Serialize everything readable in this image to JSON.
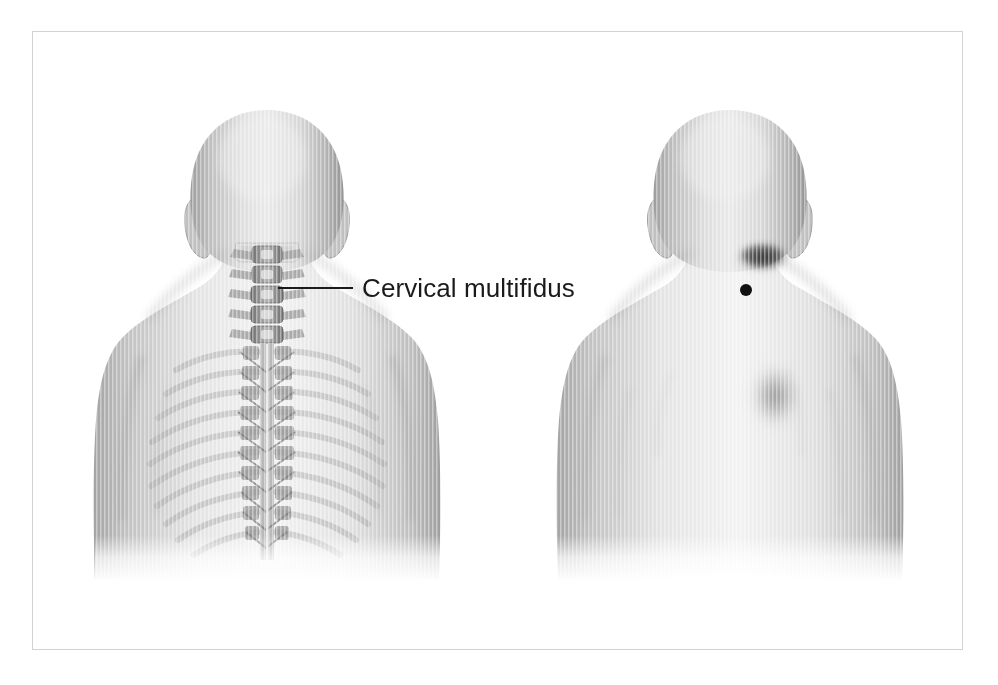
{
  "plate": {
    "title": "Cervical multifidus",
    "background_color": "#ffffff",
    "border_color": "#d2d2d2",
    "frame": {
      "x": 32,
      "y": 31,
      "width": 931,
      "height": 619
    }
  },
  "labels": [
    {
      "id": "cervical-multifidus",
      "text": "Cervical multifidus",
      "x": 362,
      "y": 275,
      "font_size_px": 26,
      "color": "#1a1a1a",
      "leader_line": {
        "x1": 278,
        "y1": 288,
        "x2": 353,
        "y2": 288,
        "color": "#1a1a1a",
        "width": 2
      }
    }
  ],
  "figures": [
    {
      "id": "posterior-skeletal-figure",
      "name": "Posterior view with cervical and thoracic spine",
      "view": "posterior",
      "side": "left",
      "center_x": 267,
      "head_top_y": 110,
      "shows": [
        "head",
        "ears",
        "neck",
        "shoulders",
        "arms",
        "torso",
        "cervical-vertebrae",
        "thoracic-vertebrae",
        "ribs",
        "multifidus-muscle"
      ],
      "skin_tone": "#c9c9c9",
      "bone_tone": "#8c8c8c",
      "vertebra_count_cervical": 6,
      "vertebra_count_thoracic": 12
    },
    {
      "id": "posterior-surface-figure",
      "name": "Posterior view with referred pain pattern",
      "view": "posterior",
      "side": "right",
      "center_x": 730,
      "head_top_y": 110,
      "shows": [
        "head",
        "ears",
        "neck",
        "shoulders",
        "arms",
        "torso",
        "trigger-point",
        "referred-pain-zones"
      ],
      "skin_tone": "#c9c9c9"
    }
  ],
  "markers": [
    {
      "id": "trigger-point",
      "type": "trigger-point-dot",
      "label": "Trigger point",
      "x": 746,
      "y": 290,
      "radius": 6,
      "color": "#111111"
    }
  ],
  "pain_zones": [
    {
      "id": "referred-pain-occipital",
      "label": "Referred pain — suboccipital",
      "x": 763,
      "y": 258,
      "rx": 28,
      "ry": 15,
      "intensity": "strong",
      "color": "#2f2f2f"
    },
    {
      "id": "referred-pain-interscapular",
      "label": "Referred pain — upper interscapular",
      "x": 775,
      "y": 396,
      "rx": 27,
      "ry": 34,
      "intensity": "moderate",
      "color": "#575757"
    }
  ],
  "colors": {
    "page_background": "#ffffff",
    "plate_border": "#d2d2d2",
    "label_text": "#1a1a1a",
    "leader_line": "#1a1a1a",
    "trigger_point": "#111111",
    "skin_light": "#ededed",
    "skin_mid": "#c6c6c6",
    "skin_dark": "#9a9a9a",
    "bone": "#8a8a8a",
    "bone_dark": "#5e5e5e"
  }
}
